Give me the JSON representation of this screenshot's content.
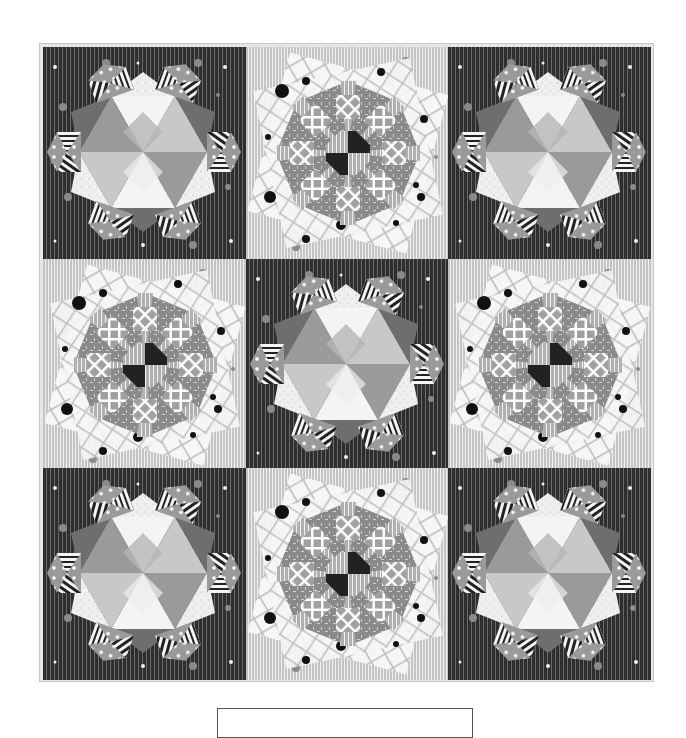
{
  "quilt": {
    "layout": "3x3 block grid",
    "colors": {
      "dark_background": "#2e2e2e",
      "light_background": "#c4c4c4",
      "border": "#e6e6e6",
      "patch_white": "#f4f4f4",
      "patch_light_gray": "#c8c8c8",
      "patch_mid_gray": "#9a9a9a",
      "patch_dark_gray": "#6e6e6e",
      "center_black": "#222222"
    },
    "blocks": [
      {
        "row": 0,
        "col": 0,
        "type": "star-hexagon",
        "background": "dark"
      },
      {
        "row": 0,
        "col": 1,
        "type": "octagon-rosette",
        "background": "light"
      },
      {
        "row": 0,
        "col": 2,
        "type": "star-hexagon",
        "background": "dark"
      },
      {
        "row": 1,
        "col": 0,
        "type": "octagon-rosette",
        "background": "light"
      },
      {
        "row": 1,
        "col": 1,
        "type": "star-hexagon",
        "background": "dark"
      },
      {
        "row": 1,
        "col": 2,
        "type": "octagon-rosette",
        "background": "light"
      },
      {
        "row": 2,
        "col": 0,
        "type": "star-hexagon",
        "background": "dark"
      },
      {
        "row": 2,
        "col": 1,
        "type": "octagon-rosette",
        "background": "light"
      },
      {
        "row": 2,
        "col": 2,
        "type": "star-hexagon",
        "background": "dark"
      }
    ]
  },
  "caption": {
    "text": ""
  }
}
